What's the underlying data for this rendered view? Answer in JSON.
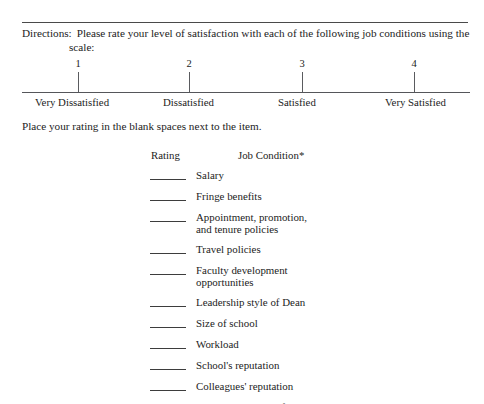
{
  "document": {
    "directions_label": "Directions:",
    "directions_body": "Please rate your level of satisfaction with each of the following job conditions using the scale:",
    "place_note": "Place your rating in the blank spaces next to the item."
  },
  "scale": {
    "points": [
      {
        "number": "1",
        "label": "Very Dissatisfied",
        "x": 78,
        "label_x": 35
      },
      {
        "number": "2",
        "label": "Dissatisfied",
        "x": 189,
        "label_x": 163
      },
      {
        "number": "3",
        "label": "Satisfied",
        "x": 302,
        "label_x": 278
      },
      {
        "number": "4",
        "label": "Very Satisfied",
        "x": 414,
        "label_x": 385
      }
    ]
  },
  "table": {
    "headers": {
      "rating": "Rating",
      "condition": "Job Condition*"
    },
    "items": [
      {
        "label": "Salary",
        "lines": 1
      },
      {
        "label": "Fringe benefits",
        "lines": 1
      },
      {
        "label": "Appointment, promotion,\nand tenure policies",
        "lines": 2
      },
      {
        "label": "Travel policies",
        "lines": 1
      },
      {
        "label": "Faculty development\nopportunities",
        "lines": 2
      },
      {
        "label": "Leadership style of Dean",
        "lines": 1
      },
      {
        "label": "Size of school",
        "lines": 1
      },
      {
        "label": "Workload",
        "lines": 1
      },
      {
        "label": "School's reputation",
        "lines": 1
      },
      {
        "label": "Colleagues' reputation",
        "lines": 1
      },
      {
        "label": "Academic quality of students",
        "lines": 1
      }
    ]
  },
  "colors": {
    "text": "#1c1c1c",
    "rule": "#4a4a4a",
    "axis": "#55565a",
    "background": "#ffffff"
  }
}
